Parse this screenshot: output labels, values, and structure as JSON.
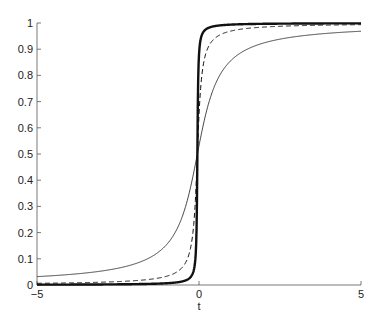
{
  "chart_data": {
    "type": "line",
    "title": "",
    "xlabel": "t",
    "ylabel": "",
    "xlim": [
      -5,
      5
    ],
    "ylim": [
      0,
      1
    ],
    "xticks": [
      "-5",
      "0",
      "5"
    ],
    "yticks": [
      "0",
      "0.1",
      "0.2",
      "0.3",
      "0.4",
      "0.5",
      "0.6",
      "0.7",
      "0.8",
      "0.9",
      "1"
    ],
    "grid": false,
    "legend": null,
    "x": [
      -5,
      -4,
      -3,
      -2,
      -1,
      -0.5,
      -0.3,
      -0.2,
      -0.1,
      -0.05,
      0,
      0.05,
      0.1,
      0.2,
      0.3,
      0.5,
      1,
      2,
      3,
      4,
      5
    ],
    "series": [
      {
        "name": "thin-solid",
        "style": "solid",
        "width": 0.8,
        "values": [
          0.032,
          0.039,
          0.053,
          0.078,
          0.148,
          0.25,
          0.328,
          0.379,
          0.437,
          0.468,
          0.5,
          0.532,
          0.563,
          0.621,
          0.672,
          0.75,
          0.852,
          0.922,
          0.947,
          0.961,
          0.968
        ]
      },
      {
        "name": "dashed",
        "style": "dashed",
        "width": 1,
        "values": [
          0.006,
          0.008,
          0.011,
          0.016,
          0.032,
          0.063,
          0.102,
          0.148,
          0.25,
          0.352,
          0.5,
          0.648,
          0.75,
          0.852,
          0.898,
          0.937,
          0.968,
          0.984,
          0.989,
          0.992,
          0.994
        ]
      },
      {
        "name": "thick-solid",
        "style": "solid",
        "width": 2.4,
        "values": [
          0.001,
          0.002,
          0.002,
          0.003,
          0.006,
          0.013,
          0.021,
          0.032,
          0.063,
          0.123,
          0.5,
          0.877,
          0.937,
          0.968,
          0.979,
          0.987,
          0.994,
          0.997,
          0.998,
          0.998,
          0.999
        ]
      }
    ]
  }
}
